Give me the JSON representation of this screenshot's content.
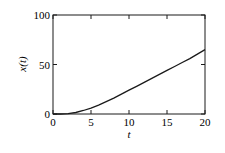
{
  "chart_data": {
    "type": "line",
    "title": "",
    "xlabel": "t",
    "ylabel": "x(t)",
    "xlim": [
      0,
      20
    ],
    "ylim": [
      0,
      100
    ],
    "xticks": [
      0,
      5,
      10,
      15,
      20
    ],
    "yticks": [
      0,
      50,
      100
    ],
    "xtick_labels": [
      "0",
      "5",
      "10",
      "15",
      "20"
    ],
    "ytick_labels": [
      "0",
      "50",
      "100"
    ],
    "grid": false,
    "legend": null,
    "series": [
      {
        "name": "x(t)",
        "x": [
          0,
          1,
          2,
          3,
          4,
          5,
          6,
          7,
          8,
          9,
          10,
          11,
          12,
          13,
          14,
          15,
          16,
          17,
          18,
          19,
          20
        ],
        "values": [
          0,
          0,
          0.3,
          1.5,
          3.5,
          6,
          9,
          12.5,
          16,
          20,
          24,
          28,
          32,
          36,
          40,
          44,
          48,
          52,
          56,
          60.5,
          65
        ]
      }
    ]
  }
}
